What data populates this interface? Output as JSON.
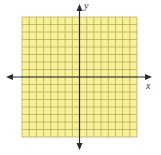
{
  "diagram": {
    "type": "coordinate-plane",
    "grid": {
      "columns": 16,
      "rows": 16,
      "fill_color": "#f7f29a",
      "line_color": "#b5ad5a"
    },
    "axes": {
      "x_label": "x",
      "y_label": "y",
      "color": "#2b2b2b",
      "arrows": [
        "left",
        "right",
        "up",
        "down"
      ]
    }
  }
}
